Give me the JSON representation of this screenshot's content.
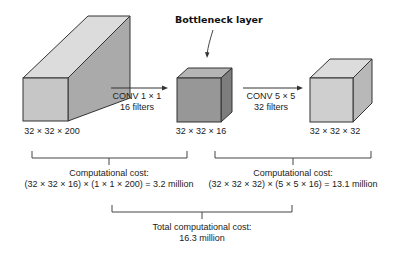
{
  "bottleneck_label": "Bottleneck layer",
  "volumes": [
    {
      "label": "32 × 32 × 200"
    },
    {
      "label": "32 × 32 × 16"
    },
    {
      "label": "32 × 32 × 32"
    }
  ],
  "operations": [
    {
      "line1": "CONV 1 × 1",
      "line2": "16 filters"
    },
    {
      "line1": "CONV 5 × 5",
      "line2": "32 filters"
    }
  ],
  "costs": [
    {
      "title": "Computational cost:",
      "formula": "(32 × 32 × 16) × (1 × 1 × 200) = 3.2 million"
    },
    {
      "title": "Computational cost:",
      "formula": "(32 × 32 × 32) × (5 × 5 × 16) = 13.1 million"
    }
  ],
  "total": {
    "title": "Total computational cost:",
    "value": "16.3 million"
  },
  "colors": {
    "front": "#c4c4c4",
    "top": "#dcdcdc",
    "side": "#a9a9a9",
    "bottleneck_front": "#999999",
    "bottleneck_top": "#b8b8b8",
    "bottleneck_side": "#7f7f7f",
    "outline": "#333333"
  }
}
